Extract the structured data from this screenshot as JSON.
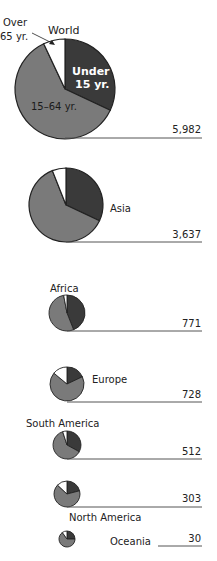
{
  "chart_data": {
    "type": "pie",
    "legend": {
      "under15": "Under 15 yr.",
      "mid": "15–64 yr.",
      "over65": "Over 65 yr.",
      "over65_line1": "Over",
      "over65_line2": "65 yr.",
      "under15_line1": "Under",
      "under15_line2": "15 yr."
    },
    "colors": {
      "under15": "#3a3a3a",
      "mid": "#7a7a7a",
      "over65": "#ffffff",
      "outline": "#222222",
      "line": "#555555"
    },
    "regions": [
      {
        "name": "World",
        "total": "5,982",
        "value": 5982,
        "shares": {
          "under15": 32,
          "mid": 61,
          "over65": 7
        }
      },
      {
        "name": "Asia",
        "total": "3,637",
        "value": 3637,
        "shares": {
          "under15": 32,
          "mid": 62,
          "over65": 6
        }
      },
      {
        "name": "Africa",
        "total": "771",
        "value": 771,
        "shares": {
          "under15": 44,
          "mid": 53,
          "over65": 3
        }
      },
      {
        "name": "Europe",
        "total": "728",
        "value": 728,
        "shares": {
          "under15": 18,
          "mid": 68,
          "over65": 14
        }
      },
      {
        "name": "South America",
        "total": "512",
        "value": 512,
        "shares": {
          "under15": 33,
          "mid": 62,
          "over65": 5
        }
      },
      {
        "name": "North America",
        "total": "303",
        "value": 303,
        "shares": {
          "under15": 21,
          "mid": 66,
          "over65": 13
        }
      },
      {
        "name": "Oceania",
        "total": "30",
        "value": 30,
        "shares": {
          "under15": 25,
          "mid": 65,
          "over65": 10
        }
      }
    ]
  }
}
